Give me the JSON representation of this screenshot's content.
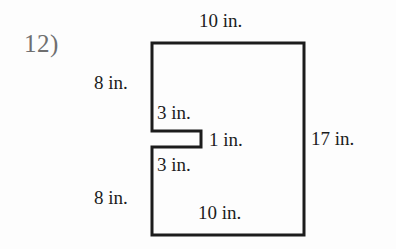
{
  "worksheet": {
    "problem_number": "12)",
    "background_color": "#fdfdfd",
    "ink_color": "#1c1c1c",
    "number_color": "#6f6f6f"
  },
  "figure": {
    "shape_name": "notched-rectangle",
    "unit": "in.",
    "stroke_color": "#1c1c1c",
    "stroke_width": 3,
    "fill": "none",
    "vertices": [
      [
        152,
        43
      ],
      [
        304,
        43
      ],
      [
        304,
        235
      ],
      [
        152,
        235
      ],
      [
        152,
        147
      ],
      [
        201,
        147
      ],
      [
        201,
        131
      ],
      [
        152,
        131
      ]
    ]
  },
  "labels": {
    "top_width": "10 in.",
    "left_upper": "8 in.",
    "notch_upper": "3 in.",
    "notch_depth": "1 in.",
    "notch_lower": "3 in.",
    "left_lower": "8 in.",
    "bottom_width": "10 in.",
    "right_height": "17 in."
  }
}
